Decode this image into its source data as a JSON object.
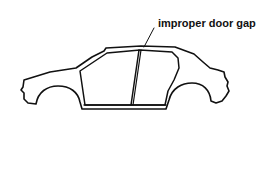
{
  "diagram": {
    "annotation": {
      "label": "improper door gap",
      "target": "gap between front and rear door"
    },
    "colors": {
      "line": "#111111",
      "background": "#ffffff"
    }
  }
}
